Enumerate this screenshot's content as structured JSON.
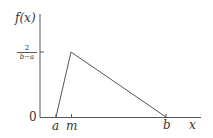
{
  "diagram": {
    "y_axis_label": "f(x)",
    "x_axis_label": "x",
    "y_ticks": [
      {
        "label": "0",
        "value": 0
      },
      {
        "label_num": "2",
        "label_den": "b−a",
        "value": "2/(b−a)"
      }
    ],
    "x_ticks": [
      {
        "label": "a"
      },
      {
        "label": "m"
      },
      {
        "label": "b"
      }
    ],
    "shape": "triangle from (a,0) to peak (m, 2/(b−a)) to (b,0)",
    "line_color": "#555555"
  }
}
